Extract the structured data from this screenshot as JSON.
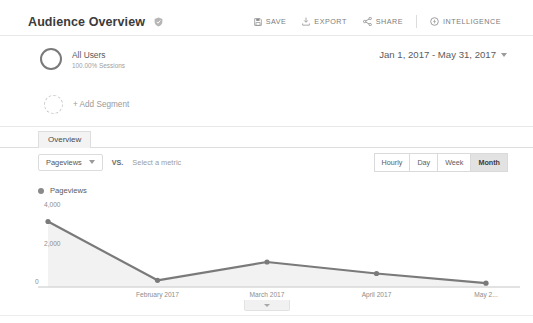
{
  "header": {
    "title": "Audience Overview",
    "title_badge_icon": "shield-check-icon",
    "actions": [
      {
        "label": "SAVE",
        "icon": "save-disk-icon"
      },
      {
        "label": "EXPORT",
        "icon": "export-download-icon"
      },
      {
        "label": "SHARE",
        "icon": "share-nodes-icon"
      },
      {
        "label": "INTELLIGENCE",
        "icon": "intelligence-spark-icon"
      }
    ]
  },
  "segments": {
    "all_users": {
      "title": "All Users",
      "subtitle": "100.00% Sessions"
    },
    "add_segment": {
      "label": "+ Add Segment"
    }
  },
  "date_range": {
    "value": "Jan 1, 2017 - May 31, 2017",
    "icon": "chevron-down-icon"
  },
  "tabs": [
    {
      "label": "Overview",
      "active": true
    }
  ],
  "controls": {
    "metric_select": {
      "value": "Pageviews",
      "icon": "chevron-down-icon"
    },
    "vs_label": "VS.",
    "compare_placeholder": "Select a metric",
    "granularity": [
      {
        "label": "Hourly",
        "active": false
      },
      {
        "label": "Day",
        "active": false
      },
      {
        "label": "Week",
        "active": false
      },
      {
        "label": "Month",
        "active": true
      }
    ]
  },
  "chart_legend": {
    "label": "Pageviews",
    "color": "#8a8a8a"
  },
  "chart_handle_icon": "collapse-caret-icon",
  "colors": {
    "line": "#7a7a7a",
    "fill": "#f2f2f2",
    "axis": "#d8d8d8",
    "text": "#8d8d8d"
  },
  "chart_data": {
    "type": "line",
    "title": "Pageviews",
    "xlabel": "",
    "ylabel": "",
    "categories": [
      "January 2017",
      "February 2017",
      "March 2017",
      "April 2017",
      "May 2017"
    ],
    "tick_labels": [
      "February 2017",
      "March 2017",
      "April 2017",
      "May 2..."
    ],
    "values": [
      3400,
      350,
      1300,
      700,
      200
    ],
    "ylim": [
      0,
      4000
    ],
    "yticks": [
      0,
      2000,
      4000
    ],
    "ytick_labels": [
      "0",
      "2,000",
      "4,000"
    ],
    "grid": false,
    "legend": "bottom-left",
    "series": [
      {
        "name": "Pageviews",
        "values": [
          3400,
          350,
          1300,
          700,
          200
        ]
      }
    ]
  }
}
